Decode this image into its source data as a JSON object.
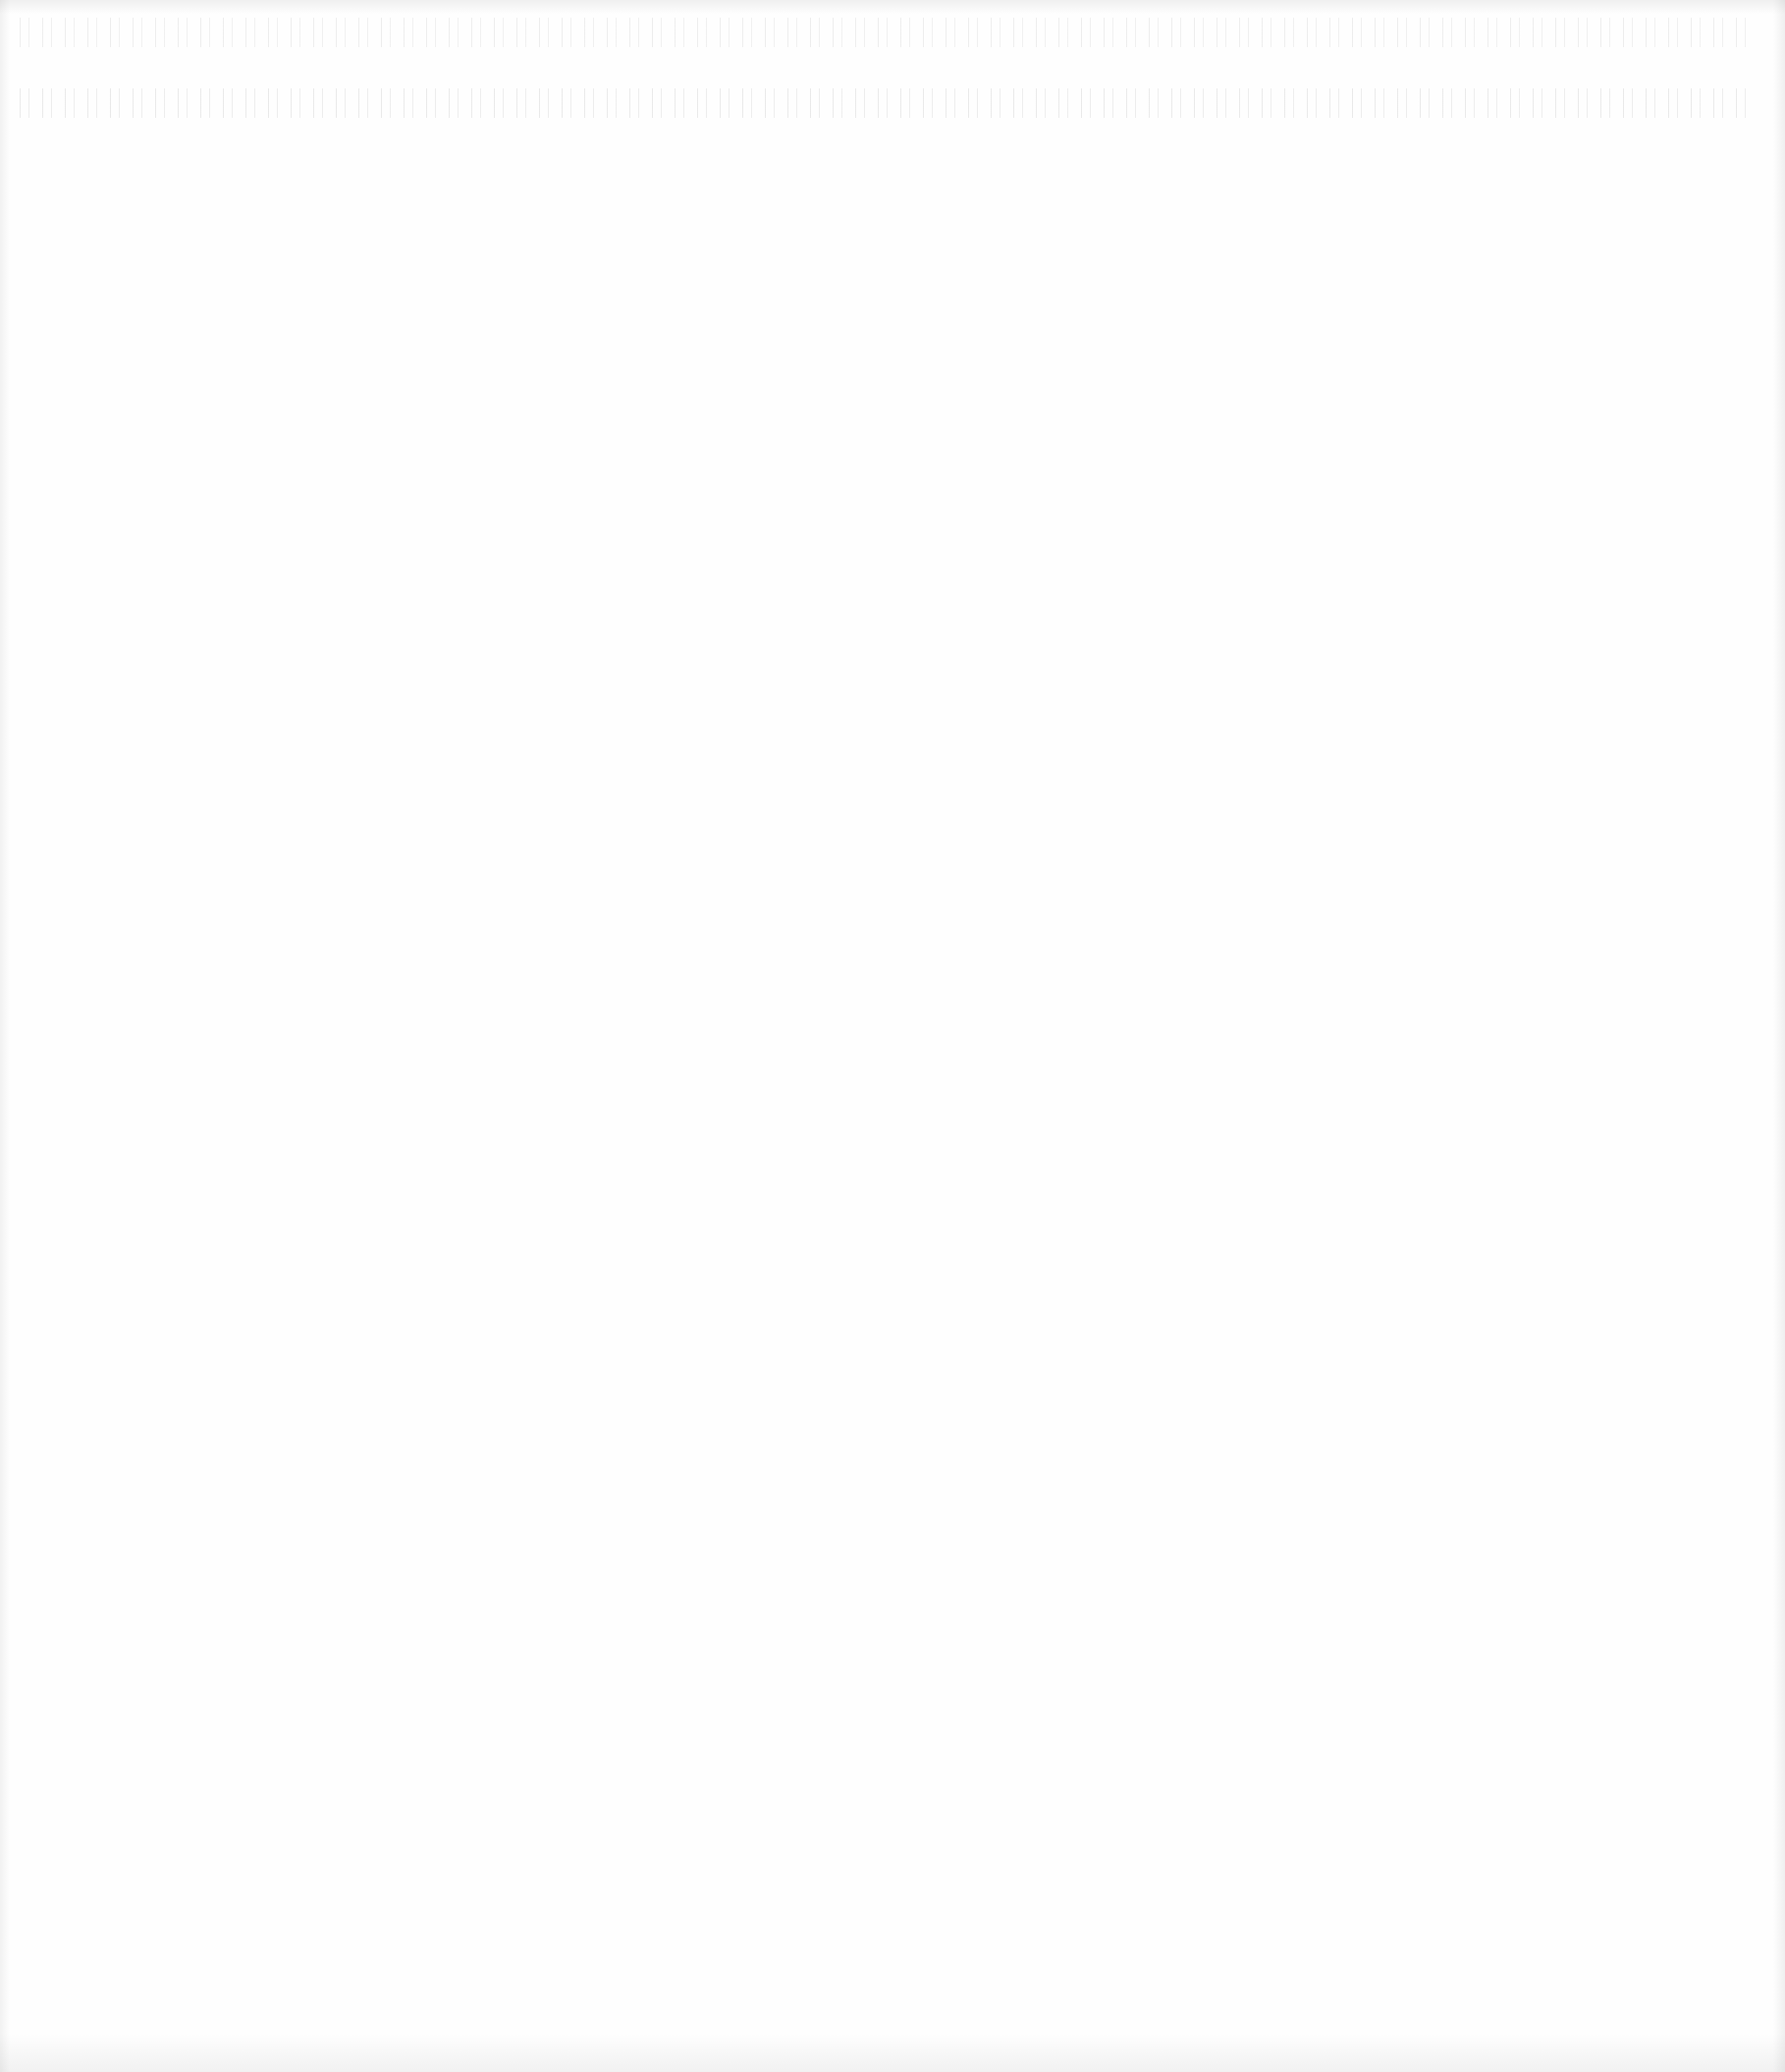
{
  "document": {
    "type": "blank-scanned-page",
    "visible_text": "",
    "background_color": "#fefefe"
  }
}
